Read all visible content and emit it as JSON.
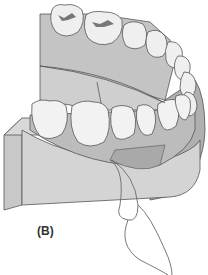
{
  "figure": {
    "panel_label": "(B)",
    "colors": {
      "base_light": "#d2d2d2",
      "base_mid": "#bdbdbd",
      "base_dark": "#a8a8a8",
      "gum": "#b5b5b5",
      "tooth": "#efefef",
      "outline": "#555555",
      "floss": "#6a6a6a"
    }
  }
}
